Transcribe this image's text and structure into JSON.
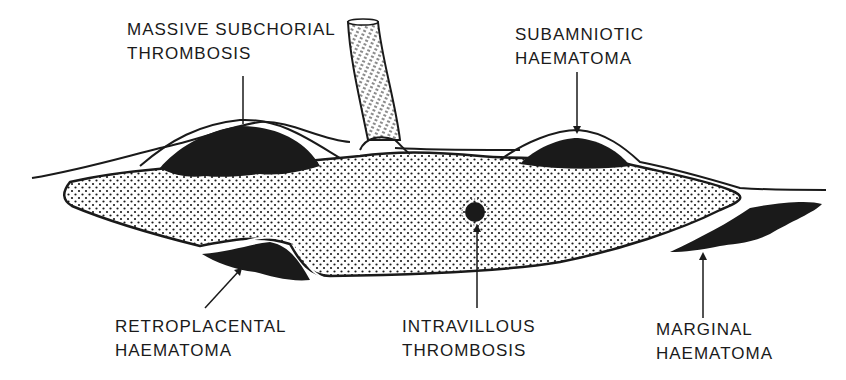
{
  "diagram": {
    "colors": {
      "ink": "#1a1a1a",
      "background": "#ffffff",
      "stipple": "#1a1a1a"
    },
    "labels": [
      {
        "id": "massive-subchorial-thrombosis",
        "line1": "MASSIVE SUBCHORIAL",
        "line2": "THROMBOSIS"
      },
      {
        "id": "subamniotic-haematoma",
        "line1": "SUBAMNIOTIC",
        "line2": "HAEMATOMA"
      },
      {
        "id": "retroplacental-haematoma",
        "line1": "RETROPLACENTAL",
        "line2": "HAEMATOMA"
      },
      {
        "id": "intravillous-thrombosis",
        "line1": "INTRAVILLOUS",
        "line2": "THROMBOSIS"
      },
      {
        "id": "marginal-haematoma",
        "line1": "MARGINAL",
        "line2": "HAEMATOMA"
      }
    ],
    "structures": [
      "umbilical-cord",
      "chorionic-plate",
      "villous-tissue",
      "basal-plate",
      "membranes"
    ]
  }
}
